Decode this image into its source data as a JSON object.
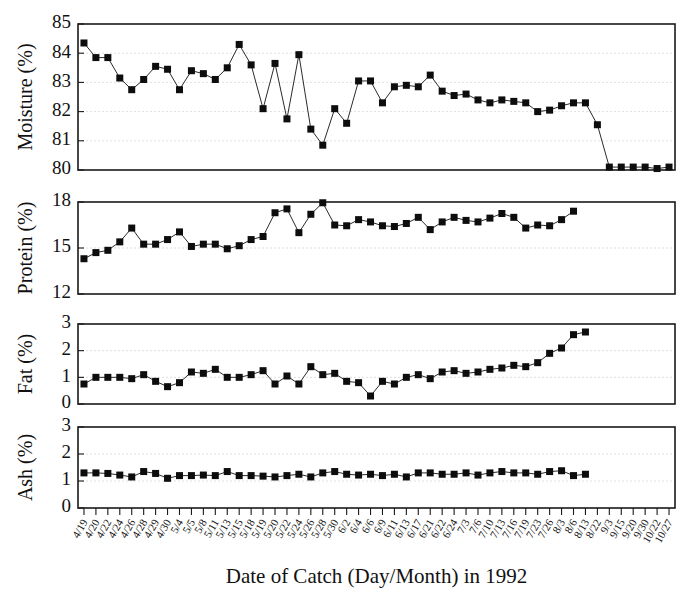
{
  "figure": {
    "xaxis_title": "Date of Catch (Day/Month) in 1992",
    "background": "#ffffff",
    "marker_color": "#0d0d0d",
    "line_color": "#2b2b2b",
    "axis_color": "#1a1a1a",
    "grid_color": "#c9c9c9"
  },
  "panels": [
    {
      "key": "moisture",
      "ylabel": "Moisture (%)",
      "yticks": [
        80,
        81,
        82,
        83,
        84,
        85
      ]
    },
    {
      "key": "protein",
      "ylabel": "Protein (%)",
      "yticks": [
        12,
        15,
        18
      ]
    },
    {
      "key": "fat",
      "ylabel": "Fat (%)",
      "yticks": [
        0,
        1,
        2,
        3
      ]
    },
    {
      "key": "ash",
      "ylabel": "Ash (%)",
      "yticks": [
        0,
        1,
        2,
        3
      ]
    }
  ],
  "chart_data": [
    {
      "type": "line",
      "title": "Moisture (%)",
      "xlabel": "Date of Catch (Day/Month) in 1992",
      "ylabel": "Moisture (%)",
      "ylim": [
        80,
        85
      ],
      "grid": true,
      "legend": "none",
      "categories": [
        "4/19",
        "4/20",
        "4/22",
        "4/24",
        "4/26",
        "4/28",
        "4/29",
        "4/30",
        "5/4",
        "5/5",
        "5/8",
        "5/11",
        "5/13",
        "5/15",
        "5/18",
        "5/19",
        "5/20",
        "5/22",
        "5/24",
        "5/26",
        "5/28",
        "5/30",
        "6/2",
        "6/4",
        "6/6",
        "6/9",
        "6/11",
        "6/13",
        "6/17",
        "6/21",
        "6/22",
        "6/24",
        "7/3",
        "7/6",
        "7/10",
        "7/13",
        "7/16",
        "7/19",
        "7/23",
        "7/26",
        "8/3",
        "8/6",
        "8/13",
        "8/22",
        "9/3",
        "9/15",
        "9/20",
        "9/30",
        "10/22",
        "10/27"
      ],
      "values": [
        84.35,
        83.85,
        83.85,
        83.15,
        82.75,
        83.1,
        83.55,
        83.45,
        82.75,
        83.4,
        83.3,
        83.1,
        83.5,
        84.3,
        83.6,
        82.1,
        83.65,
        81.75,
        83.95,
        81.4,
        80.85,
        82.1,
        81.6,
        83.05,
        83.05,
        82.3,
        82.85,
        82.9,
        82.85,
        83.25,
        82.7,
        82.55,
        82.6,
        82.4,
        82.3,
        82.4,
        82.35,
        82.3,
        82.0,
        82.05,
        82.2,
        82.3,
        82.3,
        81.55,
        80.1,
        80.1,
        80.1,
        80.1,
        80.05,
        80.1
      ]
    },
    {
      "type": "line",
      "title": "Protein (%)",
      "xlabel": "Date of Catch (Day/Month) in 1992",
      "ylabel": "Protein (%)",
      "ylim": [
        12,
        18
      ],
      "grid": true,
      "legend": "none",
      "categories": [
        "4/19",
        "4/20",
        "4/22",
        "4/24",
        "4/26",
        "4/28",
        "4/29",
        "4/30",
        "5/4",
        "5/5",
        "5/8",
        "5/11",
        "5/13",
        "5/15",
        "5/18",
        "5/19",
        "5/20",
        "5/22",
        "5/24",
        "5/26",
        "5/28",
        "5/30",
        "6/2",
        "6/4",
        "6/6",
        "6/9",
        "6/11",
        "6/13",
        "6/17",
        "6/21",
        "6/22",
        "6/24",
        "7/3",
        "7/6",
        "7/10",
        "7/13",
        "7/16",
        "7/19",
        "7/23",
        "7/26",
        "8/3",
        "8/6",
        "8/13",
        "8/22",
        "9/3",
        "9/15",
        "9/20",
        "9/30",
        "10/22",
        "10/27"
      ],
      "values": [
        14.3,
        14.7,
        14.85,
        15.4,
        16.3,
        15.25,
        15.25,
        15.55,
        16.05,
        15.1,
        15.25,
        15.25,
        14.95,
        15.15,
        15.55,
        15.75,
        17.3,
        17.55,
        16.0,
        17.2,
        17.95,
        16.5,
        16.45,
        16.85,
        16.7,
        16.45,
        16.4,
        16.6,
        17.0,
        16.2,
        16.7,
        17.0,
        16.8,
        16.7,
        16.95,
        17.25,
        17.0,
        16.3,
        16.5,
        16.45,
        16.85,
        17.4
      ]
    },
    {
      "type": "line",
      "title": "Fat (%)",
      "xlabel": "Date of Catch (Day/Month) in 1992",
      "ylabel": "Fat (%)",
      "ylim": [
        0,
        3
      ],
      "grid": true,
      "legend": "none",
      "categories": [
        "4/19",
        "4/20",
        "4/22",
        "4/24",
        "4/26",
        "4/28",
        "4/29",
        "4/30",
        "5/4",
        "5/5",
        "5/8",
        "5/11",
        "5/13",
        "5/15",
        "5/18",
        "5/19",
        "5/20",
        "5/22",
        "5/24",
        "5/26",
        "5/28",
        "5/30",
        "6/2",
        "6/4",
        "6/6",
        "6/9",
        "6/11",
        "6/13",
        "6/17",
        "6/21",
        "6/22",
        "6/24",
        "7/3",
        "7/6",
        "7/10",
        "7/13",
        "7/16",
        "7/19",
        "7/23",
        "7/26",
        "8/3",
        "8/6",
        "8/13",
        "8/22",
        "9/3",
        "9/15",
        "9/20",
        "9/30",
        "10/22",
        "10/27"
      ],
      "values": [
        0.75,
        1.0,
        1.0,
        1.0,
        0.95,
        1.1,
        0.85,
        0.65,
        0.8,
        1.2,
        1.15,
        1.3,
        1.0,
        1.0,
        1.1,
        1.25,
        0.75,
        1.05,
        0.75,
        1.4,
        1.1,
        1.15,
        0.85,
        0.8,
        0.3,
        0.85,
        0.75,
        1.0,
        1.1,
        0.95,
        1.2,
        1.25,
        1.15,
        1.2,
        1.3,
        1.35,
        1.45,
        1.4,
        1.55,
        1.9,
        2.1,
        2.6,
        2.7
      ]
    },
    {
      "type": "line",
      "title": "Ash (%)",
      "xlabel": "Date of Catch (Day/Month) in 1992",
      "ylabel": "Ash (%)",
      "ylim": [
        0,
        3
      ],
      "grid": true,
      "legend": "none",
      "categories": [
        "4/19",
        "4/20",
        "4/22",
        "4/24",
        "4/26",
        "4/28",
        "4/29",
        "4/30",
        "5/4",
        "5/5",
        "5/8",
        "5/11",
        "5/13",
        "5/15",
        "5/18",
        "5/19",
        "5/20",
        "5/22",
        "5/24",
        "5/26",
        "5/28",
        "5/30",
        "6/2",
        "6/4",
        "6/6",
        "6/9",
        "6/11",
        "6/13",
        "6/17",
        "6/21",
        "6/22",
        "6/24",
        "7/3",
        "7/6",
        "7/10",
        "7/13",
        "7/16",
        "7/19",
        "7/23",
        "7/26",
        "8/3",
        "8/6",
        "8/13",
        "8/22",
        "9/3",
        "9/15",
        "9/20",
        "9/30",
        "10/22",
        "10/27"
      ],
      "values": [
        1.3,
        1.3,
        1.28,
        1.22,
        1.15,
        1.35,
        1.28,
        1.1,
        1.2,
        1.2,
        1.22,
        1.2,
        1.35,
        1.2,
        1.2,
        1.18,
        1.15,
        1.2,
        1.25,
        1.15,
        1.3,
        1.35,
        1.25,
        1.22,
        1.25,
        1.2,
        1.25,
        1.15,
        1.3,
        1.3,
        1.25,
        1.25,
        1.3,
        1.22,
        1.3,
        1.35,
        1.3,
        1.3,
        1.25,
        1.35,
        1.38,
        1.2,
        1.25
      ]
    }
  ],
  "xticks": [
    "4/19",
    "4/20",
    "4/22",
    "4/24",
    "4/26",
    "4/28",
    "4/29",
    "4/30",
    "5/4",
    "5/5",
    "5/8",
    "5/11",
    "5/13",
    "5/15",
    "5/18",
    "5/19",
    "5/20",
    "5/22",
    "5/24",
    "5/26",
    "5/28",
    "5/30",
    "6/2",
    "6/4",
    "6/6",
    "6/9",
    "6/11",
    "6/13",
    "6/17",
    "6/21",
    "6/22",
    "6/24",
    "7/3",
    "7/6",
    "7/10",
    "7/13",
    "7/16",
    "7/19",
    "7/23",
    "7/26",
    "8/3",
    "8/6",
    "8/13",
    "8/22",
    "9/3",
    "9/15",
    "9/20",
    "9/30",
    "10/22",
    "10/27"
  ]
}
